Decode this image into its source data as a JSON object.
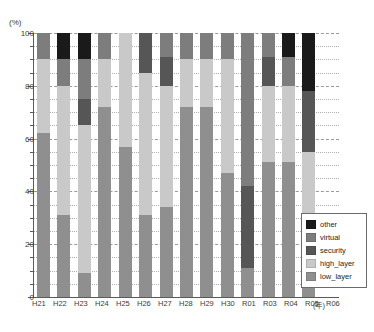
{
  "axis": {
    "unit_label": "(%)",
    "x_unit_label": "(年)",
    "y_ticks": [
      0,
      20,
      40,
      60,
      80,
      100
    ],
    "y_minor_step": 5
  },
  "legend": {
    "items": [
      {
        "label": "other",
        "color": "#1a1a1a"
      },
      {
        "label": "virtual",
        "color": "#7d7d7d"
      },
      {
        "label": "security",
        "color": "#565656"
      },
      {
        "label": "high_layer",
        "color": "#c9c9c9"
      },
      {
        "label": "low_layer",
        "color": "#8f8f8f"
      }
    ]
  },
  "chart_data": {
    "type": "bar",
    "title": "",
    "xlabel": "(年)",
    "ylabel": "(%)",
    "ylim": [
      0,
      100
    ],
    "grid": true,
    "stacked": true,
    "legend_position": "bottom-right",
    "categories": [
      "H21",
      "H22",
      "H23",
      "H24",
      "H25",
      "H26",
      "H27",
      "H28",
      "H29",
      "H30",
      "R01",
      "R03",
      "R04",
      "R05",
      "R06"
    ],
    "series": [
      {
        "name": "low_layer",
        "color": "#8f8f8f",
        "values": [
          62,
          31,
          9,
          72,
          57,
          31,
          34,
          72,
          72,
          47,
          11,
          51,
          51,
          22,
          0
        ]
      },
      {
        "name": "high_layer",
        "color": "#c9c9c9",
        "values": [
          28,
          49,
          56,
          18,
          43,
          54,
          46,
          18,
          18,
          43,
          0,
          29,
          29,
          33,
          0
        ]
      },
      {
        "name": "security",
        "color": "#565656",
        "values": [
          0,
          0,
          10,
          0,
          0,
          15,
          11,
          0,
          0,
          0,
          31,
          11,
          0,
          23,
          0
        ]
      },
      {
        "name": "virtual",
        "color": "#7d7d7d",
        "values": [
          10,
          10,
          15,
          10,
          0,
          0,
          9,
          10,
          10,
          10,
          58,
          9,
          11,
          0,
          0
        ]
      },
      {
        "name": "other",
        "color": "#1a1a1a",
        "values": [
          0,
          10,
          10,
          0,
          0,
          0,
          0,
          0,
          0,
          0,
          0,
          0,
          9,
          22,
          0
        ]
      }
    ]
  }
}
